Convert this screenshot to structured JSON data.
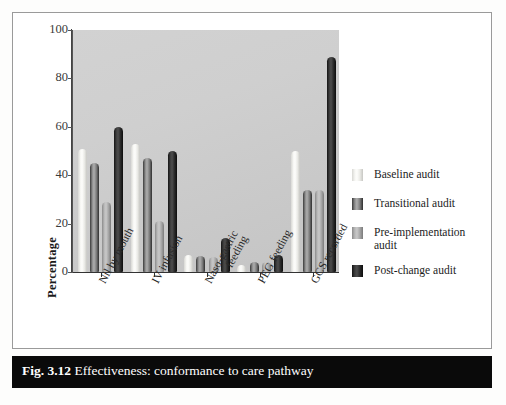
{
  "figure": {
    "caption_number": "Fig. 3.12",
    "caption_text": "Effectiveness: conformance to care pathway"
  },
  "chart_data": {
    "type": "bar",
    "title": "",
    "xlabel": "",
    "ylabel": "Percentage",
    "ylim": [
      0,
      100
    ],
    "yticks": [
      0,
      20,
      40,
      60,
      80,
      100
    ],
    "grid": false,
    "legend_position": "right",
    "categories": [
      "Nil by mouth",
      "IV infusion",
      "Naso-gastric\nfeeding",
      "PEG feeding",
      "GCS recorded"
    ],
    "series": [
      {
        "name": "Baseline audit",
        "color": "#f2f2ee",
        "values": [
          51,
          53,
          7,
          3,
          50
        ]
      },
      {
        "name": "Transitional audit",
        "color": "#8f8f8f",
        "values": [
          45,
          47,
          6.5,
          4,
          34
        ]
      },
      {
        "name": "Pre-implementation audit",
        "color": "#b5b5b5",
        "values": [
          29,
          21,
          6,
          4,
          34
        ]
      },
      {
        "name": "Post-change audit",
        "color": "#1e1e1e",
        "values": [
          60,
          50,
          14,
          7,
          89
        ]
      }
    ]
  },
  "legend": {
    "items": [
      {
        "label": "Baseline audit"
      },
      {
        "label": "Transitional audit"
      },
      {
        "label": "Pre-implementation audit"
      },
      {
        "label": "Post-change audit"
      }
    ]
  }
}
